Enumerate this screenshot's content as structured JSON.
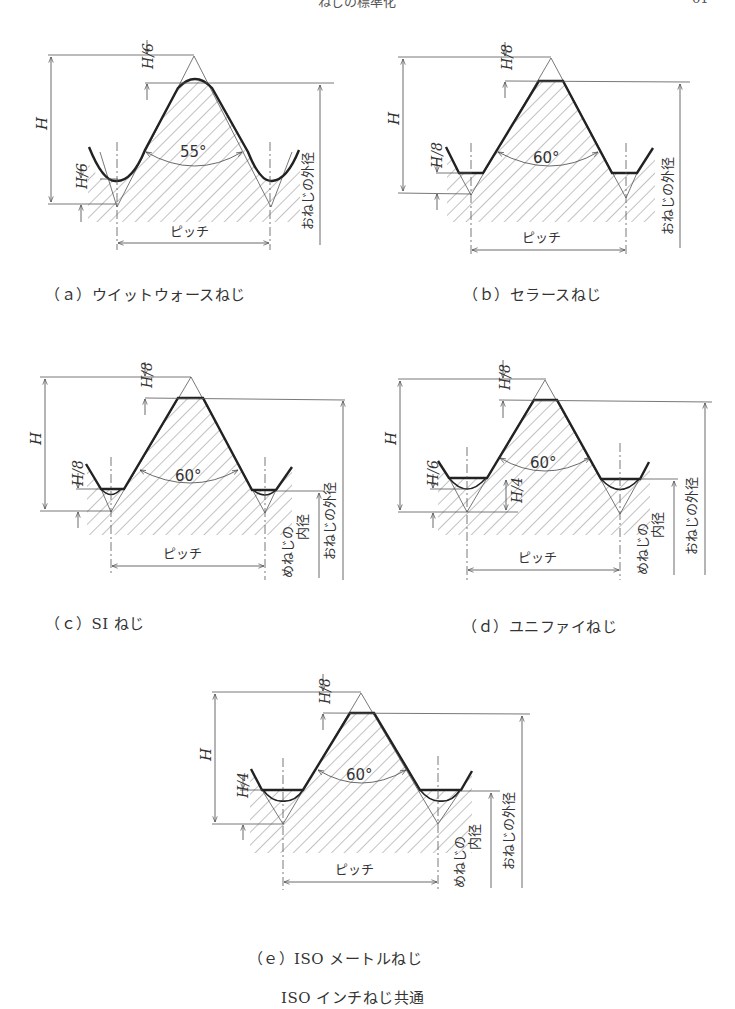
{
  "page": {
    "header_title": "ねじの標準化",
    "page_number": "61"
  },
  "labels": {
    "H": "H",
    "pitch": "ピッチ",
    "major_dia": "おねじの外径",
    "minor_dia_line1": "めねじの",
    "minor_dia_line2": "内径"
  },
  "figures": [
    {
      "id": "a",
      "caption": "（ａ）ウイットウォースねじ",
      "angle": "55°",
      "top_cut": "H/6",
      "root_cut": "H/6"
    },
    {
      "id": "b",
      "caption": "（ｂ）セラースねじ",
      "angle": "60°",
      "top_cut": "H/8",
      "root_cut": "H/8"
    },
    {
      "id": "c",
      "caption": "（ｃ）SI ねじ",
      "angle": "60°",
      "top_cut": "H/8",
      "root_cut": "H/8"
    },
    {
      "id": "d",
      "caption": "（ｄ）ユニファイねじ",
      "angle": "60°",
      "top_cut": "H/8",
      "root_cut": "H/6",
      "root_cut2": "H/4"
    },
    {
      "id": "e",
      "caption_line1": "（ｅ）ISO メートルねじ",
      "caption_line2": "ISO インチねじ共通",
      "angle": "60°",
      "top_cut": "H/8",
      "root_cut": "H/4"
    }
  ]
}
